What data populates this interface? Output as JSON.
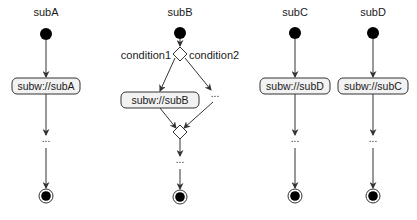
{
  "diagram": {
    "type": "uml-activity",
    "columns": [
      {
        "id": "subA",
        "title": "subA",
        "action": "subw://subA",
        "ellipsis": "...",
        "end": "final-node"
      },
      {
        "id": "subB",
        "title": "subB",
        "decision": {
          "branch_left": "condition1",
          "branch_right": "condition2"
        },
        "action": "subw://subB",
        "right_branch_ellipsis": "...",
        "after_merge_ellipsis": "...",
        "end": "final-node"
      },
      {
        "id": "subC",
        "title": "subC",
        "action": "subw://subD",
        "ellipsis": "...",
        "end": "final-node"
      },
      {
        "id": "subD",
        "title": "subD",
        "action": "subw://subC",
        "ellipsis": "...",
        "end": "final-node"
      }
    ]
  },
  "colors": {
    "stroke": "#333333",
    "box_fill": "#f2f2f2",
    "node_fill": "#000000",
    "background": "#ffffff"
  }
}
